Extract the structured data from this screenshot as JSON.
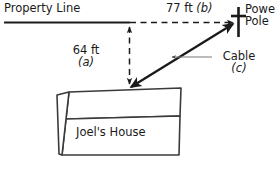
{
  "figure": {
    "background_color": "#ffffff",
    "stroke_color": "#1a1a1a",
    "leader_color": "#6e6e6e"
  },
  "labels": {
    "property_line": "Property Line",
    "top_distance": "77 ft (b)",
    "top_distance_value": "77 ft",
    "top_distance_var": "(b)",
    "power_pole_line1": "Powe",
    "power_pole_line2": "Pole",
    "power_pole_full": "Power Pole",
    "vertical_distance_value": "64 ft",
    "vertical_distance_var": "(a)",
    "cable_name": "Cable",
    "cable_var": "(c)",
    "house_name": "Joel's House"
  },
  "icons": {
    "power_pole": "power-pole-icon",
    "house": "house-box-icon"
  },
  "measurements": {
    "leg_a_label": "64 ft",
    "leg_a_variable": "a",
    "leg_b_label": "77 ft",
    "leg_b_variable": "b",
    "hypotenuse_variable": "c",
    "units": "ft"
  }
}
